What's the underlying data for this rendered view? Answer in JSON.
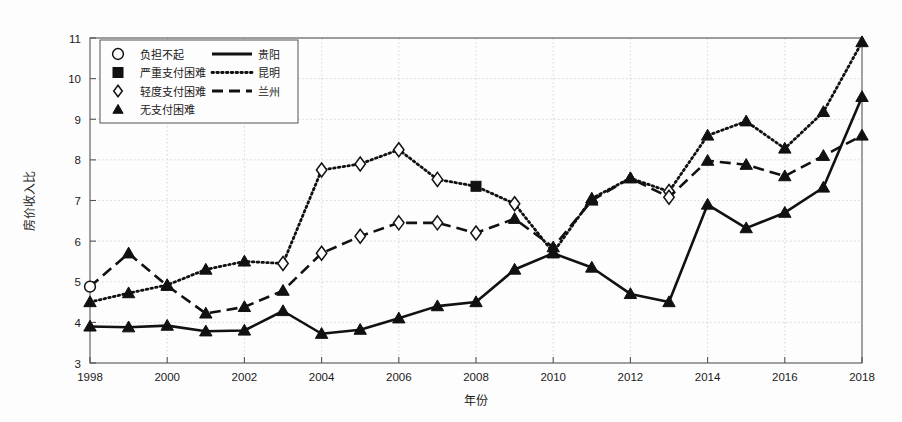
{
  "figure": {
    "background": "#fdfdfd",
    "frame_color": "#555555",
    "grid_color": "#cccccc",
    "series_color": "#111111"
  },
  "chart_data": {
    "type": "line",
    "title": "",
    "xlabel": "年份",
    "ylabel": "房价收入比",
    "xlim": [
      1998,
      2018
    ],
    "ylim": [
      3,
      11
    ],
    "yticks": [
      3,
      4,
      5,
      6,
      7,
      8,
      9,
      10,
      11
    ],
    "xticks": [
      1998,
      2000,
      2002,
      2004,
      2006,
      2008,
      2010,
      2012,
      2014,
      2016,
      2018
    ],
    "xtick_labels": [
      "1998",
      "2000",
      "2002",
      "2004",
      "2006",
      "2008",
      "2010",
      "2012",
      "2014",
      "2016",
      "2018"
    ],
    "ytick_labels": [
      "3",
      "4",
      "5",
      "6",
      "7",
      "8",
      "9",
      "10",
      "11"
    ],
    "grid": true,
    "legend_position": "upper-left",
    "x": [
      1998,
      1999,
      2000,
      2001,
      2002,
      2003,
      2004,
      2005,
      2006,
      2007,
      2008,
      2009,
      2010,
      2011,
      2012,
      2013,
      2014,
      2015,
      2016,
      2017,
      2018
    ],
    "series": [
      {
        "name": "贵阳",
        "line_style": "solid",
        "values": [
          3.9,
          3.88,
          3.92,
          3.78,
          3.8,
          4.28,
          3.72,
          3.82,
          4.1,
          4.4,
          4.5,
          5.3,
          5.7,
          5.35,
          4.7,
          4.5,
          6.9,
          6.32,
          6.7,
          7.32,
          9.55
        ],
        "markers": [
          "无支付困难",
          "无支付困难",
          "无支付困难",
          "无支付困难",
          "无支付困难",
          "无支付困难",
          "无支付困难",
          "无支付困难",
          "无支付困难",
          "无支付困难",
          "无支付困难",
          "无支付困难",
          "无支付困难",
          "无支付困难",
          "无支付困难",
          "无支付困难",
          "无支付困难",
          "无支付困难",
          "无支付困难",
          "无支付困难",
          "无支付困难"
        ]
      },
      {
        "name": "昆明",
        "line_style": "dotted",
        "values": [
          4.5,
          4.72,
          4.92,
          5.3,
          5.5,
          5.45,
          7.75,
          7.9,
          8.25,
          7.52,
          7.35,
          6.92,
          5.72,
          7.05,
          7.55,
          7.22,
          8.6,
          8.95,
          8.28,
          9.18,
          10.9
        ],
        "markers": [
          "无支付困难",
          "无支付困难",
          "无支付困难",
          "无支付困难",
          "无支付困难",
          "轻度支付困难",
          "轻度支付困难",
          "轻度支付困难",
          "轻度支付困难",
          "轻度支付困难",
          "严重支付困难",
          "轻度支付困难",
          "无支付困难",
          "无支付困难",
          "无支付困难",
          "轻度支付困难",
          "无支付困难",
          "无支付困难",
          "无支付困难",
          "无支付困难",
          "无支付困难"
        ]
      },
      {
        "name": "兰州",
        "line_style": "dashed",
        "values": [
          4.88,
          5.7,
          4.9,
          4.22,
          4.38,
          4.78,
          5.7,
          6.12,
          6.45,
          6.45,
          6.2,
          6.55,
          5.85,
          7.0,
          7.55,
          7.08,
          7.98,
          7.88,
          7.6,
          8.1,
          8.6
        ],
        "markers": [
          "负担不起",
          "无支付困难",
          "无支付困难",
          "无支付困难",
          "无支付困难",
          "无支付困难",
          "轻度支付困难",
          "轻度支付困难",
          "轻度支付困难",
          "轻度支付困难",
          "轻度支付困难",
          "无支付困难",
          "无支付困难",
          "无支付困难",
          "无支付困难",
          "轻度支付困难",
          "无支付困难",
          "无支付困难",
          "无支付困难",
          "无支付困难",
          "无支付困难"
        ]
      }
    ]
  },
  "legend": {
    "marker_entries": [
      {
        "marker": "circle-open",
        "label": "负担不起"
      },
      {
        "marker": "square-filled",
        "label": "严重支付困难"
      },
      {
        "marker": "diamond-open",
        "label": "轻度支付困难"
      },
      {
        "marker": "triangle-filled",
        "label": "无支付困难"
      }
    ],
    "line_entries": [
      {
        "style": "solid",
        "label": "贵阳"
      },
      {
        "style": "dotted",
        "label": "昆明"
      },
      {
        "style": "dashed",
        "label": "兰州"
      }
    ]
  }
}
